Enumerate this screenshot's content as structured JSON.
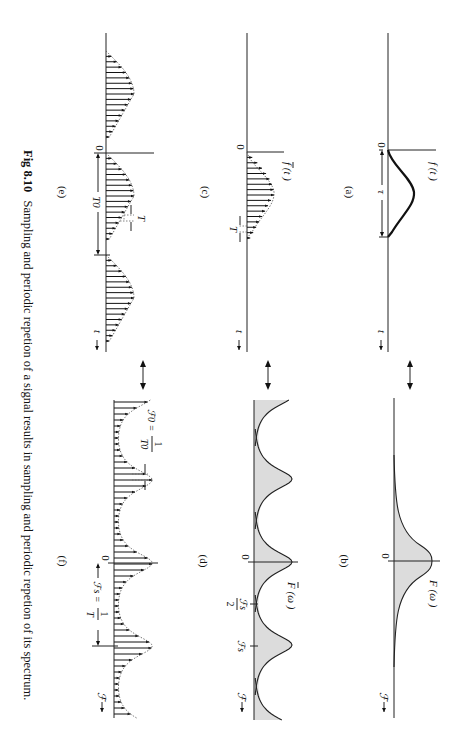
{
  "figure": {
    "number": "Fig 8.10",
    "caption": "Sampling and periodic repetion of a signal results in sampling and periodic repetion of its spectrum.",
    "orientation": "rotated 90 degrees clockwise"
  },
  "panels": {
    "a": {
      "label": "(a)",
      "func": "f (t )",
      "origin": "0",
      "width_label": "τ",
      "axis_label": "t"
    },
    "b": {
      "label": "(b)",
      "func": "F (ω )",
      "origin": "0",
      "axis_label": "ℱ"
    },
    "c": {
      "label": "(c)",
      "func": "f (t )",
      "origin": "0",
      "spacing_label": "T",
      "axis_label": "t"
    },
    "d": {
      "label": "(d)",
      "func": "F (ω )",
      "origin": "0",
      "half_label_num": "ℱs",
      "half_label_den": "2",
      "fs_label": "ℱs",
      "axis_label": "ℱ"
    },
    "e": {
      "label": "(e)",
      "origin": "0",
      "period_label": "T0",
      "spacing_label": "T",
      "axis_label": "t"
    },
    "f": {
      "label": "(f)",
      "origin": "0",
      "f0_label": "ℱ0 =",
      "f0_num": "1",
      "f0_den": "T0",
      "fs_label": "ℱs =",
      "fs_num": "1",
      "fs_den": "T",
      "axis_label": "ℱ"
    }
  },
  "colors": {
    "ink": "#111111",
    "spectrum_fill": "#dcdcdc",
    "background": "#ffffff"
  }
}
